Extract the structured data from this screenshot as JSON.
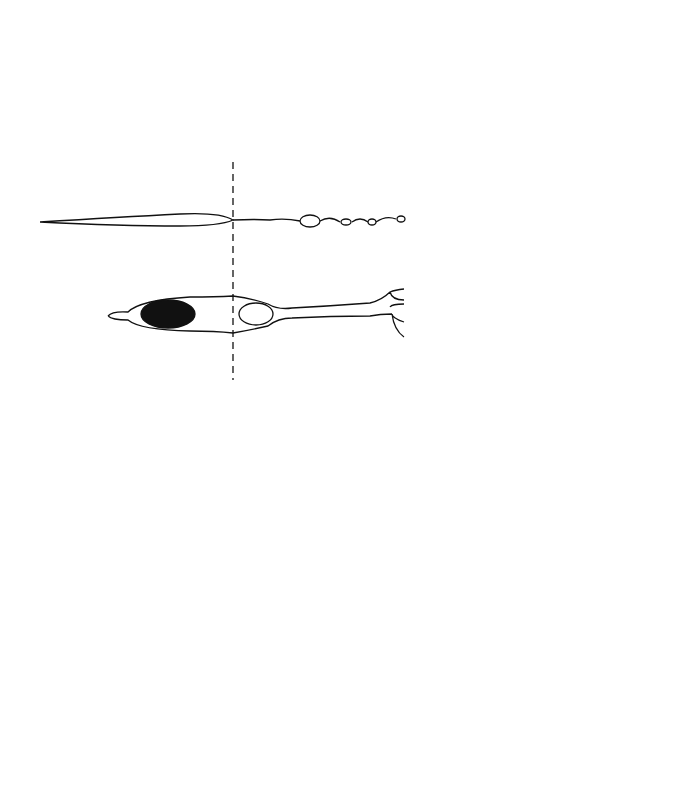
{
  "figure": {
    "background": "#ffffff",
    "ink": "#111111",
    "labels": []
  },
  "cell_schematic": {
    "divider": {
      "x": 233,
      "y1": 162,
      "y2": 380,
      "dashed": true
    },
    "upper_cell": {
      "type": "fusiform-fiber",
      "x_start": 40,
      "x_end": 405,
      "y": 221,
      "varicosities": [
        310,
        346,
        372,
        401
      ]
    },
    "lower_cell": {
      "type": "bipolar-cell",
      "x_start": 108,
      "x_end": 410,
      "y": 314,
      "nucleus_filled": {
        "cx": 168,
        "cy": 314,
        "rx": 27,
        "ry": 14
      },
      "nucleus_open": {
        "cx": 256,
        "cy": 314,
        "rx": 17,
        "ry": 11
      },
      "dendrite_branches": 4
    }
  },
  "fovea_section": {
    "bounds": {
      "x": 430,
      "y": 43,
      "w": 210,
      "h": 345
    },
    "pit_apex": {
      "x": 488,
      "y": 222
    },
    "layers": [
      "inner limiting membrane",
      "ganglion cell layer",
      "inner plexiform",
      "inner nuclear",
      "outer plexiform (Henle fibers)",
      "outer nuclear",
      "photoreceptors",
      "pigment epithelium"
    ]
  },
  "layered_section": {
    "bounds": {
      "x": 57,
      "y": 432,
      "w": 580,
      "h": 322
    },
    "bands": [
      {
        "name": "inner limiting membrane",
        "x": 57,
        "w": 4,
        "kind": "solid-line"
      },
      {
        "name": "nerve fiber layer",
        "x": 62,
        "w": 24,
        "kind": "dashes-vertical"
      },
      {
        "name": "ganglion cell layer",
        "x": 86,
        "w": 60,
        "kind": "large-circles",
        "r": 9
      },
      {
        "name": "inner plexiform layer",
        "x": 146,
        "w": 55,
        "kind": "dashes-horizontal"
      },
      {
        "name": "inner nuclear layer",
        "x": 200,
        "w": 60,
        "kind": "small-circles",
        "r": 6
      },
      {
        "name": "outer plexiform layer",
        "x": 262,
        "w": 72,
        "kind": "dashes-horizontal-dense"
      },
      {
        "name": "outer nuclear layer",
        "x": 335,
        "w": 150,
        "kind": "medium-circles",
        "r": 7
      },
      {
        "name": "photoreceptor layer",
        "x": 486,
        "w": 92,
        "kind": "rods-cones",
        "count": 22
      },
      {
        "name": "outer segment granules",
        "x": 568,
        "w": 14,
        "kind": "stipple"
      },
      {
        "name": "interstitial circles",
        "x": 578,
        "w": 18,
        "kind": "sparse-circles",
        "r": 5
      },
      {
        "name": "pigment epithelium",
        "x": 598,
        "w": 38,
        "kind": "solid-bar"
      }
    ]
  }
}
